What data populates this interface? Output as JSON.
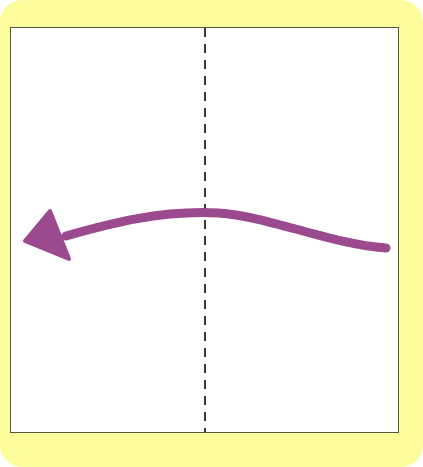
{
  "figure": {
    "width": 423,
    "height": 467,
    "background_color": "#ffffff"
  },
  "frame": {
    "name": "yellow-card-frame",
    "fill_color": "#fcfc9c",
    "corner_radius": 22,
    "x": 0,
    "y": 0,
    "width": 423,
    "height": 467
  },
  "panel": {
    "name": "white-drawing-panel",
    "fill_color": "#ffffff",
    "border_color": "#555a3f",
    "border_width": 1,
    "x": 10,
    "y": 27,
    "width": 389,
    "height": 406
  },
  "dashed_axis": {
    "name": "vertical-dashed-line",
    "color": "#3a3a3a",
    "stroke_width": 2,
    "dash_length": 9,
    "gap_length": 7,
    "x": 205,
    "y_start": 28,
    "y_end": 432,
    "orientation": "vertical"
  },
  "arrow": {
    "name": "curved-arrow",
    "color": "#9b4a8f",
    "stroke_width": 9,
    "direction": "leftward",
    "cap": "round",
    "tail_point": {
      "x": 386,
      "y": 248
    },
    "apex_point": {
      "x": 213,
      "y": 213
    },
    "head_tip": {
      "x": 25,
      "y": 241
    },
    "curve_path": "M 386 248 C 330 244 268 216 218 213 C 160 210 108 224 66 236",
    "head_polygon": "25,241 50,211 69,259",
    "crosses_axis_at": {
      "x": 205,
      "y": 213
    }
  },
  "chart_data": {
    "type": "line",
    "xlabel": "",
    "ylabel": "",
    "grid": false,
    "legend": null,
    "xlim": [
      10,
      399
    ],
    "ylim": [
      433,
      27
    ],
    "annotations": [
      {
        "kind": "dashed-vertical-line",
        "x": 205,
        "color": "#3a3a3a"
      },
      {
        "kind": "arrow-head",
        "x": 25,
        "y": 241,
        "color": "#9b4a8f"
      }
    ],
    "series": [
      {
        "name": "arrow-curve",
        "color": "#9b4a8f",
        "x": [
          386,
          340,
          300,
          260,
          218,
          180,
          140,
          100,
          66
        ],
        "y": [
          248,
          239,
          230,
          220,
          213,
          213,
          218,
          228,
          236
        ]
      }
    ]
  }
}
